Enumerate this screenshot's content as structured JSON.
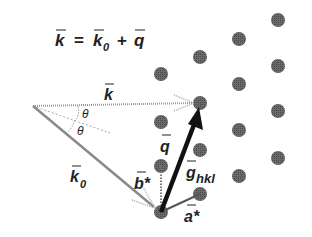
{
  "equation": {
    "k": "k",
    "equals": "=",
    "k0_base": "k",
    "k0_sub": "0",
    "plus": "+",
    "q": "q"
  },
  "labels": {
    "k": "k",
    "k0_base": "k",
    "k0_sub": "0",
    "theta1": "θ",
    "theta2": "θ",
    "q": "q",
    "b_star": "b*",
    "g_base": "g",
    "g_sub": "hkl",
    "a_star": "a*"
  },
  "colors": {
    "dot": "#5a5a5a",
    "incident_vector": "#9a9a9a",
    "q_vector": "#111111",
    "text": "#222222"
  },
  "lattice_points": [
    {
      "x": 161,
      "y": 74
    },
    {
      "x": 161,
      "y": 122
    },
    {
      "x": 161,
      "y": 166
    },
    {
      "x": 161,
      "y": 212
    },
    {
      "x": 200,
      "y": 57
    },
    {
      "x": 200,
      "y": 103
    },
    {
      "x": 200,
      "y": 150
    },
    {
      "x": 200,
      "y": 194
    },
    {
      "x": 239,
      "y": 39
    },
    {
      "x": 239,
      "y": 84
    },
    {
      "x": 239,
      "y": 130
    },
    {
      "x": 239,
      "y": 176
    },
    {
      "x": 278,
      "y": 20
    },
    {
      "x": 278,
      "y": 66
    },
    {
      "x": 278,
      "y": 111
    },
    {
      "x": 278,
      "y": 158
    }
  ]
}
